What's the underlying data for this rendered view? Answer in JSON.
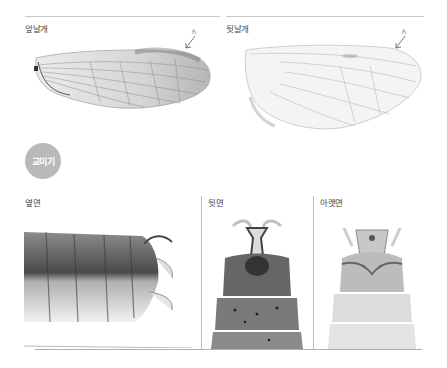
{
  "wings": {
    "forewing": {
      "label": "앞날개",
      "annotation": "f₁"
    },
    "hindwing": {
      "label": "뒷날개",
      "annotation": "f₁"
    }
  },
  "genitalia": {
    "section_badge": "교미기",
    "views": [
      {
        "label": "옆면"
      },
      {
        "label": "뒷면"
      },
      {
        "label": "아랫면"
      }
    ]
  },
  "colors": {
    "badge_bg": "#b9b9b9",
    "rule": "#c8c8c8"
  }
}
